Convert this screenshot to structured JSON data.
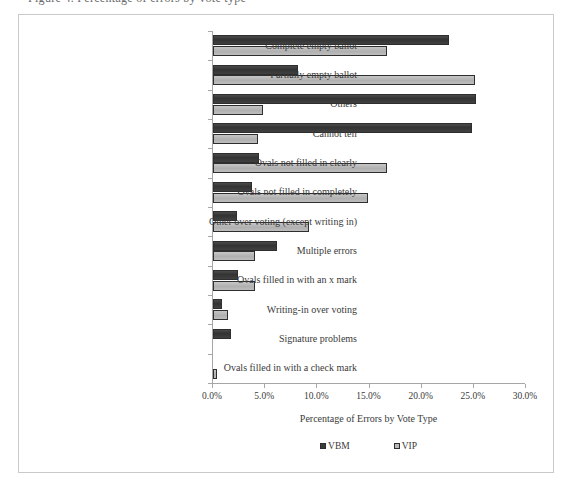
{
  "header": {
    "cut_off_line": "Figure 4.  Percentage of errors by vote type"
  },
  "chart_data": {
    "type": "bar",
    "orientation": "horizontal",
    "title": "",
    "xlabel": "Percentage of Errors by Vote Type",
    "ylabel": "",
    "xlim": [
      0,
      30
    ],
    "xtick_labels": [
      "0.0%",
      "5.0%",
      "10.0%",
      "15.0%",
      "20.0%",
      "25.0%",
      "30.0%"
    ],
    "xtick_values": [
      0,
      5,
      10,
      15,
      20,
      25,
      30
    ],
    "grid": false,
    "legend_position": "bottom",
    "categories": [
      "Complete empty ballot",
      "Partially empty ballot",
      "Others",
      "Cannot tell",
      "Ovals not filled in clearly",
      "Ovals not filled in completely",
      "Other over voting (except writing in)",
      "Multiple errors",
      "Ovals filled in with an x mark",
      "Writing-in over voting",
      "Signature problems",
      "Ovals filled in with a check mark"
    ],
    "series": [
      {
        "name": "VBM",
        "color": "#3c3c3c",
        "values": [
          22.6,
          8.1,
          25.2,
          24.8,
          4.4,
          3.7,
          2.3,
          6.1,
          2.4,
          0.9,
          1.7,
          0.0
        ]
      },
      {
        "name": "VIP",
        "color": "#b9b9b9",
        "values": [
          16.7,
          25.1,
          4.8,
          4.3,
          16.7,
          14.9,
          9.2,
          4.0,
          4.0,
          1.4,
          0.0,
          0.4
        ]
      }
    ]
  },
  "legend": {
    "items": [
      {
        "label": "VBM",
        "swatch": "dark-square-swatch"
      },
      {
        "label": "VIP",
        "swatch": "light-square-swatch"
      }
    ]
  }
}
